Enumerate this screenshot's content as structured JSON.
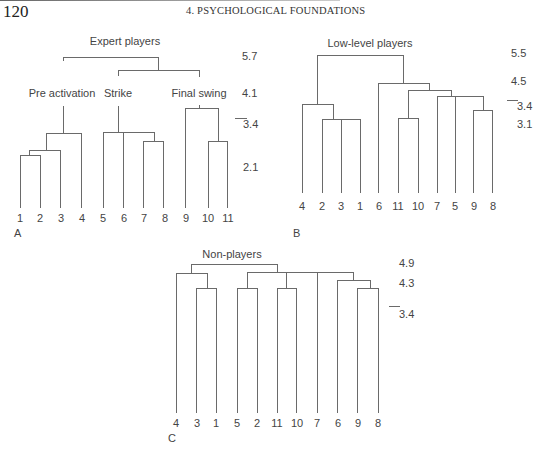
{
  "header": {
    "page_number": "120",
    "running_head": "4. PSYCHOLOGICAL FOUNDATIONS"
  },
  "panels": [
    {
      "id": "A",
      "title": "Expert players",
      "panel_label": "A",
      "leaf_order": [
        "1",
        "2",
        "3",
        "4",
        "5",
        "6",
        "7",
        "8",
        "9",
        "10",
        "11"
      ],
      "cluster_labels": [
        "Pre activation",
        "Strike",
        "Final swing"
      ],
      "scale_values": [
        "5.7",
        "4.1",
        "3.4",
        "2.1"
      ],
      "cut_marker": "3.4"
    },
    {
      "id": "B",
      "title": "Low-level players",
      "panel_label": "B",
      "leaf_order": [
        "4",
        "2",
        "3",
        "1",
        "6",
        "11",
        "10",
        "7",
        "5",
        "9",
        "8"
      ],
      "scale_values": [
        "5.5",
        "4.5",
        "3.4",
        "3.1"
      ],
      "cut_marker": "3.4"
    },
    {
      "id": "C",
      "title": "Non-players",
      "panel_label": "C",
      "leaf_order": [
        "4",
        "3",
        "1",
        "5",
        "2",
        "11",
        "10",
        "7",
        "6",
        "9",
        "8"
      ],
      "scale_values": [
        "4.9",
        "4.3",
        "3.4"
      ],
      "cut_marker": "3.4"
    }
  ],
  "colors": {
    "line": "#6a6a6a",
    "text": "#444444"
  }
}
